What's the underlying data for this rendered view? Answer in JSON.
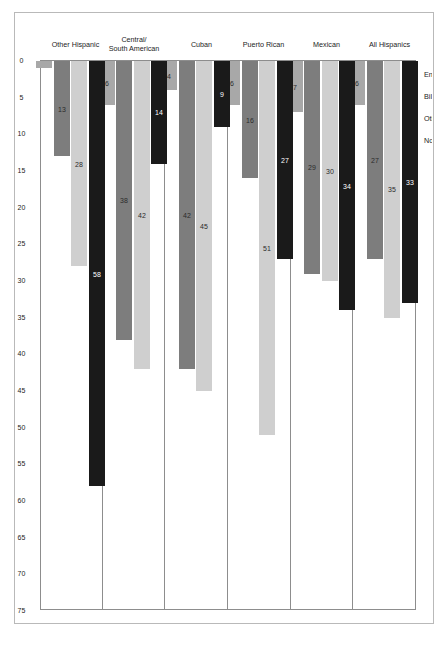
{
  "chart_data": {
    "type": "bar",
    "orientation": "horizontal",
    "title": "",
    "subtitle": "",
    "xlabel": "",
    "ylabel": "",
    "xlim": [
      0,
      75
    ],
    "grid": false,
    "legend_position": "bottom-left",
    "axis_ticks": [
      "75",
      "70",
      "65",
      "60",
      "55",
      "50",
      "45",
      "40",
      "35",
      "30",
      "25",
      "20",
      "15",
      "10",
      "5",
      "0"
    ],
    "axis_tick_values": [
      75,
      70,
      65,
      60,
      55,
      50,
      45,
      40,
      35,
      30,
      25,
      20,
      15,
      10,
      5,
      0
    ],
    "categories": [
      "All Hispanics",
      "Mexican",
      "Puerto Rican",
      "Cuban",
      "Central/\nSouth American",
      "Other Hispanic"
    ],
    "series": [
      {
        "name": "English monoliterate",
        "color": "#1a1a1a",
        "values": [
          33,
          34,
          27,
          9,
          14,
          58
        ],
        "labels": [
          "33",
          "34",
          "27",
          "9",
          "14",
          "58"
        ]
      },
      {
        "name": "Biliterate",
        "color": "#cfcfcf",
        "values": [
          35,
          30,
          51,
          45,
          42,
          28
        ],
        "labels": [
          "35",
          "30",
          "51",
          "45",
          "42",
          "28"
        ]
      },
      {
        "name": "Other monoliterate",
        "color": "#7d7d7d",
        "values": [
          27,
          29,
          16,
          42,
          38,
          13
        ],
        "labels": [
          "27",
          "29",
          "16",
          "42",
          "38",
          "13"
        ]
      },
      {
        "name": "Not literate",
        "color": "#a8a8a8",
        "values": [
          6,
          7,
          6,
          4,
          6,
          1
        ],
        "labels": [
          "6",
          "7",
          "6",
          "4",
          "6",
          ""
        ]
      }
    ],
    "colors": {
      "english_monoliterate": "#1a1a1a",
      "biliterate": "#cfcfcf",
      "other_monoliterate": "#7d7d7d",
      "not_literate": "#a8a8a8",
      "frame": "#8d8d8d",
      "page_frame": "#b9b9b9",
      "text": "#1c1c1c",
      "background": "#ffffff"
    }
  }
}
